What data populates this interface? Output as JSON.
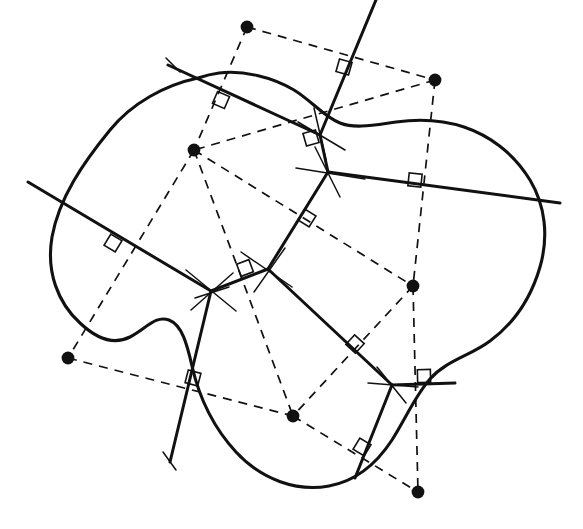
{
  "figure": {
    "background_color": "#ffffff",
    "ink_color": "#111111",
    "width": 583,
    "height": 529
  },
  "legend": {
    "site_label": "site point",
    "delaunay_label": "Delaunay edge (dashed)",
    "voronoi_label": "Voronoi edge / perpendicular bisector (solid)",
    "right_angle_label": "right angle mark"
  },
  "chart_data": {
    "type": "scatter",
    "xlabel": "",
    "ylabel": "",
    "xlim": [
      0,
      583
    ],
    "ylim": [
      0,
      529
    ],
    "grid": false,
    "legend_position": "none",
    "sites": [
      {
        "id": "S1",
        "x": 247,
        "y": 27
      },
      {
        "id": "S2",
        "x": 435,
        "y": 80
      },
      {
        "id": "S3",
        "x": 194,
        "y": 150
      },
      {
        "id": "S4",
        "x": 413,
        "y": 286
      },
      {
        "id": "S5",
        "x": 68,
        "y": 358
      },
      {
        "id": "S6",
        "x": 293,
        "y": 416
      },
      {
        "id": "S7",
        "x": 418,
        "y": 492
      }
    ],
    "voronoi_vertices": [
      {
        "id": "V1",
        "x": 320,
        "y": 135
      },
      {
        "id": "V2",
        "x": 328,
        "y": 172
      },
      {
        "id": "V3",
        "x": 268,
        "y": 269
      },
      {
        "id": "V4",
        "x": 211,
        "y": 291
      },
      {
        "id": "V5",
        "x": 392,
        "y": 385
      }
    ],
    "delaunay_edges": [
      {
        "from": "S1",
        "to": "S2"
      },
      {
        "from": "S1",
        "to": "S3"
      },
      {
        "from": "S2",
        "to": "S3"
      },
      {
        "from": "S2",
        "to": "S4"
      },
      {
        "from": "S3",
        "to": "S4"
      },
      {
        "from": "S3",
        "to": "S5"
      },
      {
        "from": "S3",
        "to": "S6"
      },
      {
        "from": "S4",
        "to": "S6"
      },
      {
        "from": "S4",
        "to": "S7"
      },
      {
        "from": "S5",
        "to": "S6"
      },
      {
        "from": "S6",
        "to": "S7"
      }
    ],
    "voronoi_edges": [
      {
        "from": "V1",
        "to": "V2",
        "bisects": "S2-S3"
      },
      {
        "from": "V2",
        "to": "V3",
        "bisects": "S3-S4"
      },
      {
        "from": "V3",
        "to": "V4",
        "bisects": "S3-S6"
      },
      {
        "from": "V3",
        "to": "V5",
        "bisects": "S4-S6"
      },
      {
        "from": "V1",
        "to": "ray-top-left",
        "bisects": "S1-S3"
      },
      {
        "from": "V1",
        "to": "ray-top-right",
        "bisects": "S1-S2"
      },
      {
        "from": "V2",
        "to": "ray-right",
        "bisects": "S2-S4"
      },
      {
        "from": "V4",
        "to": "ray-left",
        "bisects": "S3-S5"
      },
      {
        "from": "V4",
        "to": "ray-bottom",
        "bisects": "S5-S6"
      },
      {
        "from": "V5",
        "to": "ray-right-lower",
        "bisects": "S4-S7"
      },
      {
        "from": "V5",
        "to": "ray-bottom-left",
        "bisects": "S6-S7"
      }
    ],
    "right_angle_marks": [
      {
        "id": "RA1",
        "x": 221,
        "y": 100,
        "on_edge": "S1-S3"
      },
      {
        "id": "RA2",
        "x": 344,
        "y": 67,
        "on_edge": "S1-S2"
      },
      {
        "id": "RA3",
        "x": 311,
        "y": 138,
        "on_edge": "S2-S3"
      },
      {
        "id": "RA4",
        "x": 415,
        "y": 180,
        "on_edge": "S2-S4"
      },
      {
        "id": "RA5",
        "x": 307,
        "y": 218,
        "on_edge": "S3-S4"
      },
      {
        "id": "RA6",
        "x": 245,
        "y": 268,
        "on_edge": "S3-S6"
      },
      {
        "id": "RA7",
        "x": 113,
        "y": 243,
        "on_edge": "S3-S5"
      },
      {
        "id": "RA8",
        "x": 193,
        "y": 378,
        "on_edge": "S5-S6"
      },
      {
        "id": "RA9",
        "x": 355,
        "y": 344,
        "on_edge": "S4-S6"
      },
      {
        "id": "RA10",
        "x": 424,
        "y": 376,
        "on_edge": "S4-S7"
      },
      {
        "id": "RA11",
        "x": 362,
        "y": 447,
        "on_edge": "S6-S7"
      }
    ],
    "counts": {
      "sites": 7,
      "voronoi_vertices": 5,
      "delaunay_edges": 11,
      "right_angle_marks": 11
    }
  }
}
